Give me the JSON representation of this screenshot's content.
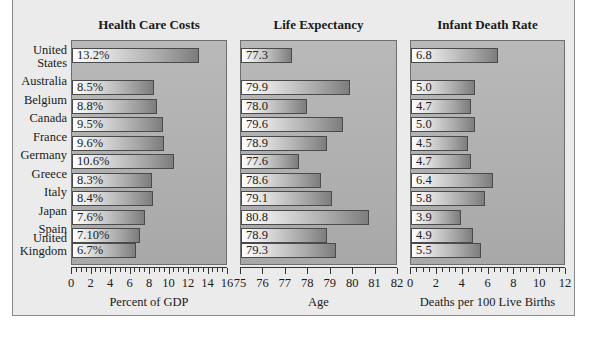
{
  "chart_data": [
    {
      "type": "bar",
      "orientation": "horizontal",
      "title": "Health Care Costs",
      "xlabel": "Percent of GDP",
      "ylabel": "",
      "xlim": [
        0,
        16
      ],
      "xticks": [
        "0",
        "2",
        "4",
        "6",
        "8",
        "10",
        "12",
        "14",
        "16"
      ],
      "categories": [
        "United States",
        "Australia",
        "Belgium",
        "Canada",
        "France",
        "Germany",
        "Greece",
        "Italy",
        "Japan",
        "Spain",
        "United Kingdom"
      ],
      "values": [
        13.2,
        8.5,
        8.8,
        9.5,
        9.6,
        10.6,
        8.3,
        8.4,
        7.6,
        7.1,
        6.7
      ],
      "labels": [
        "13.2%",
        "8.5%",
        "8.8%",
        "9.5%",
        "9.6%",
        "10.6%",
        "8.3%",
        "8.4%",
        "7.6%",
        "7.10%",
        "6.7%"
      ],
      "grid": false
    },
    {
      "type": "bar",
      "orientation": "horizontal",
      "title": "Life Expectancy",
      "xlabel": "Age",
      "ylabel": "",
      "xlim": [
        75,
        82
      ],
      "xticks": [
        "75",
        "76",
        "77",
        "78",
        "79",
        "80",
        "81",
        "82"
      ],
      "categories": [
        "United States",
        "Australia",
        "Belgium",
        "Canada",
        "France",
        "Germany",
        "Greece",
        "Italy",
        "Japan",
        "Spain",
        "United Kingdom"
      ],
      "values": [
        77.3,
        79.9,
        78.0,
        79.6,
        78.9,
        77.6,
        78.6,
        79.1,
        80.8,
        78.9,
        79.3
      ],
      "labels": [
        "77.3",
        "79.9",
        "78.0",
        "79.6",
        "78.9",
        "77.6",
        "78.6",
        "79.1",
        "80.8",
        "78.9",
        "79.3"
      ],
      "grid": false
    },
    {
      "type": "bar",
      "orientation": "horizontal",
      "title": "Infant Death Rate",
      "xlabel": "Deaths per 100 Live Births",
      "ylabel": "",
      "xlim": [
        0,
        12
      ],
      "xticks": [
        "0",
        "2",
        "4",
        "6",
        "8",
        "10",
        "12"
      ],
      "categories": [
        "United States",
        "Australia",
        "Belgium",
        "Canada",
        "France",
        "Germany",
        "Greece",
        "Italy",
        "Japan",
        "Spain",
        "United Kingdom"
      ],
      "values": [
        6.8,
        5.0,
        4.7,
        5.0,
        4.5,
        4.7,
        6.4,
        5.8,
        3.9,
        4.9,
        5.5
      ],
      "labels": [
        "6.8",
        "5.0",
        "4.7",
        "5.0",
        "4.5",
        "4.7",
        "6.4",
        "5.8",
        "3.9",
        "4.9",
        "5.5"
      ],
      "grid": false
    }
  ],
  "countries": [
    {
      "line1": "United",
      "line2": "States"
    },
    {
      "line1": "Australia",
      "line2": ""
    },
    {
      "line1": "Belgium",
      "line2": ""
    },
    {
      "line1": "Canada",
      "line2": ""
    },
    {
      "line1": "France",
      "line2": ""
    },
    {
      "line1": "Germany",
      "line2": ""
    },
    {
      "line1": "Greece",
      "line2": ""
    },
    {
      "line1": "Italy",
      "line2": ""
    },
    {
      "line1": "Japan",
      "line2": ""
    },
    {
      "line1": "Spain",
      "line2": ""
    },
    {
      "line1": "United",
      "line2": "Kingdom"
    }
  ],
  "colors": {
    "frame_bg": "#ebebeb",
    "plot_bg": "#b0b0b0",
    "bar_start": "#ffffff",
    "bar_end": "#7d7d7d",
    "border": "#4a4a4a"
  }
}
